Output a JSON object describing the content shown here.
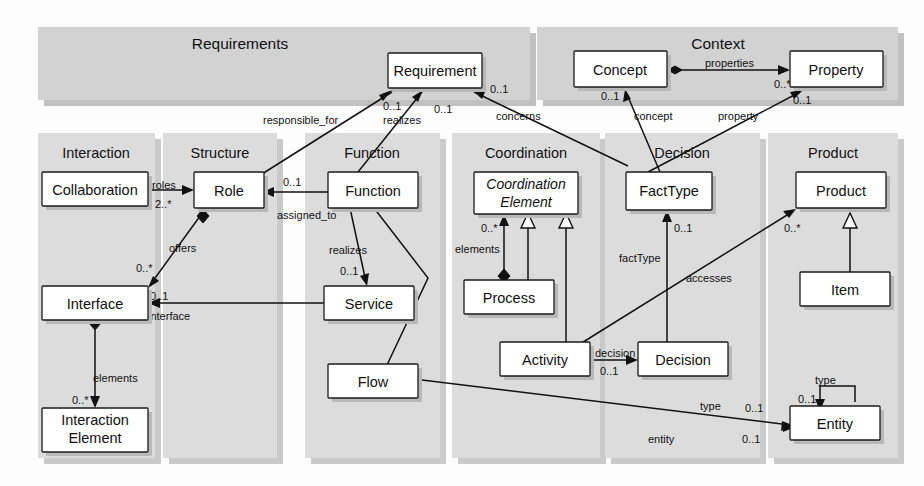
{
  "diagram": {
    "colors": {
      "band_fill": "#d2d2d2",
      "column_fill": "#dcdcdc",
      "box_fill": "#ffffff",
      "line": "#111111",
      "page_background": "#fdfdfd"
    },
    "top_bands": [
      {
        "id": "requirements",
        "label": "Requirements"
      },
      {
        "id": "context",
        "label": "Context"
      }
    ],
    "columns": [
      {
        "id": "interaction",
        "label": "Interaction"
      },
      {
        "id": "structure",
        "label": "Structure"
      },
      {
        "id": "function",
        "label": "Function"
      },
      {
        "id": "coordination",
        "label": "Coordination"
      },
      {
        "id": "decision",
        "label": "Decision"
      },
      {
        "id": "product",
        "label": "Product"
      }
    ],
    "classes": [
      {
        "id": "requirement",
        "label": "Requirement",
        "package": "requirements",
        "abstract": false
      },
      {
        "id": "concept",
        "label": "Concept",
        "package": "context",
        "abstract": false
      },
      {
        "id": "property",
        "label": "Property",
        "package": "context",
        "abstract": false
      },
      {
        "id": "collaboration",
        "label": "Collaboration",
        "package": "interaction",
        "abstract": false
      },
      {
        "id": "interface",
        "label": "Interface",
        "package": "interaction",
        "abstract": false
      },
      {
        "id": "interaction-element",
        "label": "Interaction\nElement",
        "line1": "Interaction",
        "line2": "Element",
        "package": "interaction",
        "abstract": false
      },
      {
        "id": "role",
        "label": "Role",
        "package": "structure",
        "abstract": false
      },
      {
        "id": "function",
        "label": "Function",
        "package": "function",
        "abstract": false
      },
      {
        "id": "service",
        "label": "Service",
        "package": "function",
        "abstract": false
      },
      {
        "id": "flow",
        "label": "Flow",
        "package": "function",
        "abstract": false
      },
      {
        "id": "coordination-element",
        "label": "Coordination Element",
        "line1": "Coordination",
        "line2": "Element",
        "package": "coordination",
        "abstract": true
      },
      {
        "id": "process",
        "label": "Process",
        "package": "coordination",
        "abstract": false
      },
      {
        "id": "activity",
        "label": "Activity",
        "package": "coordination",
        "abstract": false
      },
      {
        "id": "facttype",
        "label": "FactType",
        "package": "decision",
        "abstract": false
      },
      {
        "id": "decision",
        "label": "Decision",
        "package": "decision",
        "abstract": false
      },
      {
        "id": "product",
        "label": "Product",
        "package": "product",
        "abstract": false
      },
      {
        "id": "item",
        "label": "Item",
        "package": "product",
        "abstract": false
      },
      {
        "id": "entity",
        "label": "Entity",
        "package": "product",
        "abstract": false
      }
    ],
    "associations": [
      {
        "id": "role-responsible-for-requirement",
        "from": "role",
        "to": "requirement",
        "label": "responsible_for",
        "multiplicity": "0..1",
        "kind": "directed"
      },
      {
        "id": "function-realizes-requirement",
        "from": "function",
        "to": "requirement",
        "label": "realizes",
        "multiplicity": "0..1",
        "kind": "directed"
      },
      {
        "id": "facttype-concerns-requirement",
        "from": "facttype",
        "to": "requirement",
        "label": "concerns",
        "multiplicity": "0..1",
        "kind": "directed"
      },
      {
        "id": "concept-properties-property",
        "from": "concept",
        "to": "property",
        "label": "properties",
        "multiplicity": "0..*",
        "kind": "aggregation"
      },
      {
        "id": "facttype-concept",
        "from": "facttype",
        "to": "concept",
        "label": "concept",
        "multiplicity": "0..1",
        "kind": "directed"
      },
      {
        "id": "facttype-property",
        "from": "facttype",
        "to": "property",
        "label": "property",
        "multiplicity": "0..1",
        "kind": "directed"
      },
      {
        "id": "collaboration-roles-role",
        "from": "collaboration",
        "to": "role",
        "label": "roles",
        "multiplicity": "2..*",
        "kind": "directed"
      },
      {
        "id": "function-assigned-to-role",
        "from": "function",
        "to": "role",
        "label": "assigned_to",
        "multiplicity": "0..1",
        "kind": "directed"
      },
      {
        "id": "role-offers-interface",
        "from": "role",
        "to": "interface",
        "label": "offers",
        "multiplicity": "0..*",
        "kind": "aggregation"
      },
      {
        "id": "service-interface",
        "from": "service",
        "to": "interface",
        "label": "interface",
        "multiplicity": "0..1",
        "kind": "directed"
      },
      {
        "id": "function-realizes-service",
        "from": "function",
        "to": "service",
        "label": "realizes",
        "multiplicity": "0..1",
        "kind": "directed"
      },
      {
        "id": "interface-elements-interaction-element",
        "from": "interface",
        "to": "interaction-element",
        "label": "elements",
        "multiplicity": "0..*",
        "kind": "aggregation"
      },
      {
        "id": "coordination-element-elements-process",
        "from": "process",
        "to": "coordination-element",
        "label": "elements",
        "multiplicity": "0..*",
        "kind": "aggregation"
      },
      {
        "id": "process-generalizes-coordination-element",
        "from": "process",
        "to": "coordination-element",
        "label": "",
        "multiplicity": "",
        "kind": "generalization"
      },
      {
        "id": "activity-generalizes-coordination-element",
        "from": "activity",
        "to": "coordination-element",
        "label": "",
        "multiplicity": "",
        "kind": "generalization"
      },
      {
        "id": "activity-decision",
        "from": "activity",
        "to": "decision",
        "label": "decision",
        "multiplicity": "0..1",
        "kind": "directed"
      },
      {
        "id": "decision-facttype",
        "from": "decision",
        "to": "facttype",
        "label": "factType",
        "multiplicity": "0..1",
        "kind": "directed"
      },
      {
        "id": "activity-accesses-product",
        "from": "activity",
        "to": "product",
        "label": "accesses",
        "multiplicity": "0..*",
        "kind": "directed"
      },
      {
        "id": "item-generalizes-product",
        "from": "item",
        "to": "product",
        "label": "",
        "multiplicity": "",
        "kind": "generalization"
      },
      {
        "id": "flow-type-entity",
        "from": "flow",
        "to": "entity",
        "label": "type",
        "multiplicity": "0..1",
        "kind": "directed"
      },
      {
        "id": "item-entity",
        "from": "item",
        "to": "entity",
        "label": "entity",
        "multiplicity": "0..1",
        "kind": "directed"
      },
      {
        "id": "entity-type-self",
        "from": "entity",
        "to": "entity",
        "label": "type",
        "multiplicity": "0..1",
        "kind": "directed"
      },
      {
        "id": "function-flow",
        "from": "function",
        "to": "flow",
        "label": "",
        "multiplicity": "",
        "kind": "plain"
      }
    ],
    "edge_labels": [
      {
        "id": "lbl-responsible-for",
        "text": "responsible_for"
      },
      {
        "id": "lbl-realizes-req",
        "text": "realizes"
      },
      {
        "id": "lbl-concerns",
        "text": "concerns"
      },
      {
        "id": "lbl-properties",
        "text": "properties"
      },
      {
        "id": "lbl-concept",
        "text": "concept"
      },
      {
        "id": "lbl-property",
        "text": "property"
      },
      {
        "id": "lbl-roles",
        "text": "roles"
      },
      {
        "id": "lbl-assigned-to",
        "text": "assigned_to"
      },
      {
        "id": "lbl-offers",
        "text": "offers"
      },
      {
        "id": "lbl-interface",
        "text": "interface"
      },
      {
        "id": "lbl-realizes-svc",
        "text": "realizes"
      },
      {
        "id": "lbl-elements-ia",
        "text": "elements"
      },
      {
        "id": "lbl-elements-co",
        "text": "elements"
      },
      {
        "id": "lbl-decision",
        "text": "decision"
      },
      {
        "id": "lbl-facttype",
        "text": "factType"
      },
      {
        "id": "lbl-accesses",
        "text": "accesses"
      },
      {
        "id": "lbl-type-flow",
        "text": "type"
      },
      {
        "id": "lbl-entity",
        "text": "entity"
      },
      {
        "id": "lbl-type-entity",
        "text": "type"
      }
    ],
    "multiplicity_labels": [
      {
        "id": "m-req-a",
        "text": "0..1"
      },
      {
        "id": "m-req-b",
        "text": "0..1"
      },
      {
        "id": "m-req-c",
        "text": "0..1"
      },
      {
        "id": "m-prop",
        "text": "0..*"
      },
      {
        "id": "m-prop-2",
        "text": "0..1"
      },
      {
        "id": "m-concept",
        "text": "0..1"
      },
      {
        "id": "m-roles",
        "text": "2..*"
      },
      {
        "id": "m-assigned",
        "text": "0..1"
      },
      {
        "id": "m-offers",
        "text": "0..*"
      },
      {
        "id": "m-iface",
        "text": "0..1"
      },
      {
        "id": "m-realizes",
        "text": "0..1"
      },
      {
        "id": "m-elem-ia",
        "text": "0..*"
      },
      {
        "id": "m-elem-co",
        "text": "0..*"
      },
      {
        "id": "m-decision",
        "text": "0..1"
      },
      {
        "id": "m-facttype",
        "text": "0..1"
      },
      {
        "id": "m-access",
        "text": "0..*"
      },
      {
        "id": "m-type-fl",
        "text": "0..1"
      },
      {
        "id": "m-entity",
        "text": "0..1"
      },
      {
        "id": "m-type-en",
        "text": "0..1"
      }
    ]
  }
}
